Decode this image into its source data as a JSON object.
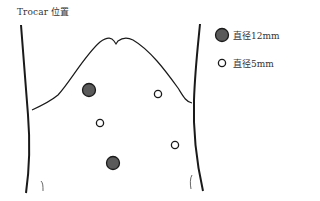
{
  "title": "Trocar 位置",
  "legend": {
    "items": [
      {
        "label": "直径12mm",
        "symbol": "filled-circle",
        "fill": "#5a5a5a"
      },
      {
        "label": "直径5mm",
        "symbol": "open-circle",
        "fill": "#ffffff"
      }
    ]
  },
  "ports": [
    {
      "type": "12mm",
      "cx": 89,
      "cy": 90
    },
    {
      "type": "5mm",
      "cx": 158,
      "cy": 94
    },
    {
      "type": "5mm",
      "cx": 100,
      "cy": 123
    },
    {
      "type": "5mm",
      "cx": 175,
      "cy": 145
    },
    {
      "type": "12mm",
      "cx": 113,
      "cy": 163
    }
  ],
  "colors": {
    "line": "#1a1a1a",
    "port_12mm": "#5a5a5a",
    "port_5mm": "#ffffff"
  }
}
